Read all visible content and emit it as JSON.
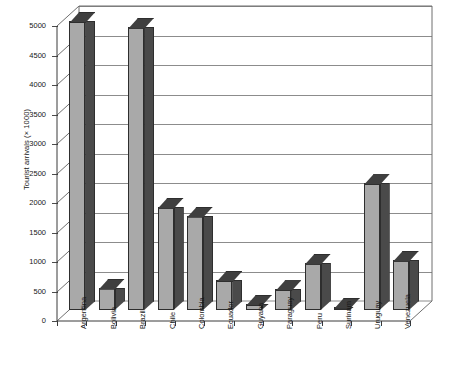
{
  "chart_data": {
    "type": "bar",
    "title": "",
    "xlabel": "",
    "ylabel": "Tourist arrivals (× 1000)",
    "ylim": [
      0,
      5000
    ],
    "ytick_step": 500,
    "yticks": [
      "0",
      "500",
      "1000",
      "1500",
      "2000",
      "2500",
      "3000",
      "3500",
      "4000",
      "4500",
      "5000"
    ],
    "grid": true,
    "legend": "none",
    "style": "3d-bar",
    "categories": [
      "Argentina",
      "Bolivia",
      "Brazil",
      "Chile",
      "Colombia",
      "Ecuador",
      "Guyana",
      "Paraguay",
      "Peru",
      "Surinam",
      "Uruguay",
      "Venezuela"
    ],
    "values": [
      4900,
      380,
      4800,
      1750,
      1600,
      510,
      100,
      350,
      800,
      55,
      2150,
      850
    ],
    "series": [
      {
        "name": "Tourist arrivals",
        "values": [
          4900,
          380,
          4800,
          1750,
          1600,
          510,
          100,
          350,
          800,
          55,
          2150,
          850
        ]
      }
    ],
    "colors": {
      "bar_front": "#a9a9a9",
      "bar_side": "#4a4a4a",
      "bar_top": "#3f3f3f",
      "gridline": "#8c8c8c",
      "axis": "#3a3a3a",
      "background": "#ffffff"
    }
  }
}
